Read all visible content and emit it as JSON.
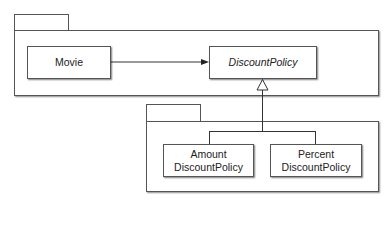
{
  "diagram": {
    "type": "UML class/package diagram",
    "packages": [
      {
        "id": "top-package",
        "label": "",
        "contains": [
          "Movie",
          "DiscountPolicy"
        ]
      },
      {
        "id": "bottom-package",
        "label": "",
        "contains": [
          "AmountDiscountPolicy",
          "PercentDiscountPolicy"
        ]
      }
    ],
    "classes": {
      "movie": {
        "name": "Movie",
        "abstract": false
      },
      "discount_policy": {
        "name": "DiscountPolicy",
        "abstract": true
      },
      "amount": {
        "line1": "Amount",
        "line2": "DiscountPolicy",
        "abstract": false
      },
      "percent": {
        "line1": "Percent",
        "line2": "DiscountPolicy",
        "abstract": false
      }
    },
    "relations": [
      {
        "from": "Movie",
        "to": "DiscountPolicy",
        "kind": "association (navigable arrow)"
      },
      {
        "from": "AmountDiscountPolicy",
        "to": "DiscountPolicy",
        "kind": "generalization"
      },
      {
        "from": "PercentDiscountPolicy",
        "to": "DiscountPolicy",
        "kind": "generalization"
      }
    ],
    "colors": {
      "line": "#333333",
      "border": "#555555",
      "background": "#ffffff"
    }
  }
}
